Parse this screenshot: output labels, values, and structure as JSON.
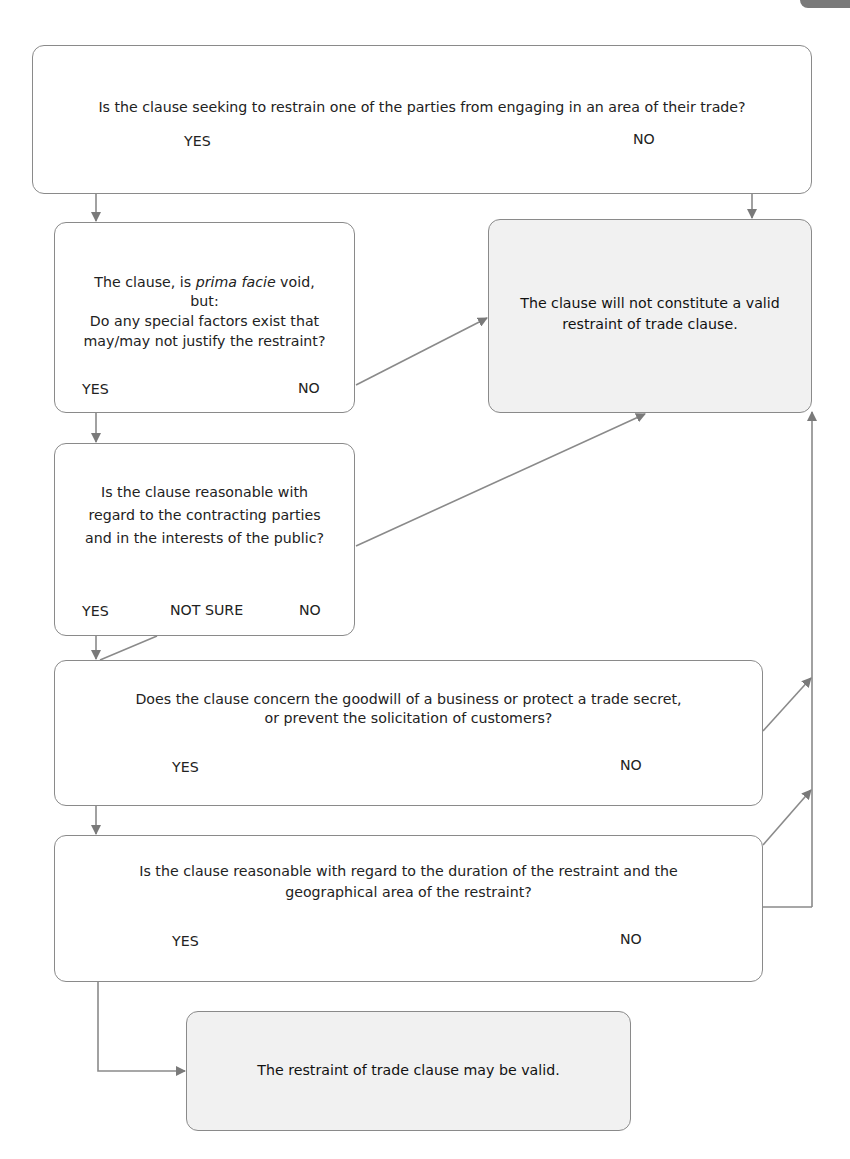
{
  "diagram": {
    "colors": {
      "stroke": "#8a8a8a",
      "arrow": "#7a7a7a",
      "outcome_fill": "#f1f1f1",
      "question_fill": "#ffffff",
      "text": "#222222"
    },
    "nodes": {
      "q1": {
        "text": "Is the clause seeking to restrain one of the parties from engaging in an area of their trade?",
        "options": {
          "yes": "YES",
          "no": "NO"
        }
      },
      "q2": {
        "line1_pre": "The clause, is ",
        "line1_italic": "prima facie",
        "line1_post": " void,",
        "line2": "but:",
        "line3": "Do any special factors exist that",
        "line4": "may/may not justify the restraint?",
        "options": {
          "yes": "YES",
          "no": "NO"
        }
      },
      "q3": {
        "line1": "Is the clause reasonable with",
        "line2": "regard to the contracting parties",
        "line3": "and in the interests of the public?",
        "options": {
          "yes": "YES",
          "not_sure": "NOT SURE",
          "no": "NO"
        }
      },
      "q4": {
        "line1": "Does the clause concern the goodwill of a business or protect a trade secret,",
        "line2": "or prevent the solicitation of customers?",
        "options": {
          "yes": "YES",
          "no": "NO"
        }
      },
      "q5": {
        "line1": "Is the clause reasonable with regard to the duration of the restraint and the",
        "line2": "geographical area of the restraint?",
        "options": {
          "yes": "YES",
          "no": "NO"
        }
      },
      "outcome_invalid": {
        "line1": "The clause will not constitute a valid",
        "line2": "restraint of trade clause."
      },
      "outcome_valid": {
        "text": "The restraint of trade clause may be valid."
      }
    },
    "edges": [
      {
        "from": "q1",
        "label": "YES",
        "to": "q2"
      },
      {
        "from": "q1",
        "label": "NO",
        "to": "outcome_invalid"
      },
      {
        "from": "q2",
        "label": "YES",
        "to": "q3"
      },
      {
        "from": "q2",
        "label": "NO",
        "to": "outcome_invalid"
      },
      {
        "from": "q3",
        "label": "YES",
        "to": "q4"
      },
      {
        "from": "q3",
        "label": "NOT SURE",
        "to": "q4"
      },
      {
        "from": "q3",
        "label": "NO",
        "to": "outcome_invalid"
      },
      {
        "from": "q4",
        "label": "YES",
        "to": "q5"
      },
      {
        "from": "q4",
        "label": "NO",
        "to": "outcome_invalid"
      },
      {
        "from": "q5",
        "label": "YES",
        "to": "outcome_valid"
      },
      {
        "from": "q5",
        "label": "NO",
        "to": "outcome_invalid"
      }
    ]
  }
}
